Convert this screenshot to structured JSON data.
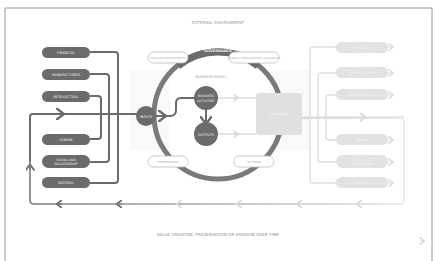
{
  "diagram": {
    "external_environment": "EXTERNAL ENVIRONMENT",
    "governance": "GOVERNANCE",
    "business_model": "BUSINESS MODEL",
    "pills_top": [
      "RISKS AND OPPORTUNITIES",
      "STRATEGY AND RESOURCE ALLOCATION"
    ],
    "pills_bottom": [
      "PERFORMANCE",
      "OUTLOOK"
    ],
    "inputs": "INPUTS",
    "business_activities": [
      "BUSINESS",
      "ACTIVITIES"
    ],
    "outputs": "OUTPUTS",
    "outcomes_box": [
      "OUTCOMES"
    ],
    "capitals_left": [
      {
        "label": "FINANCIAL"
      },
      {
        "label": "MANUFACTURED"
      },
      {
        "label": "INTELLECTUAL"
      },
      {
        "label": "HUMAN"
      },
      {
        "label": "SOCIAL AND",
        "label2": "RELATIONSHIP"
      },
      {
        "label": "NATURAL"
      }
    ],
    "capitals_right": [
      {
        "label": "FINANCIAL"
      },
      {
        "label": "MANUFACTURED"
      },
      {
        "label": "INTELLECTUAL"
      },
      {
        "label": "HUMAN"
      },
      {
        "label": "SOCIAL AND",
        "label2": "RELATIONSHIP"
      },
      {
        "label": "NATURAL"
      }
    ],
    "timeline": "VALUE CREATION, PRESERVATION OR EROSION OVER TIME",
    "colors": {
      "dark": "#6b6b6b",
      "ring": "#7a7a7a",
      "faded": "#dcdcdc",
      "faded_text": "#f2f2f2",
      "frame": "#9a9a9a",
      "pill_border": "#bdbdbd",
      "label": "#9a9a9a"
    }
  }
}
